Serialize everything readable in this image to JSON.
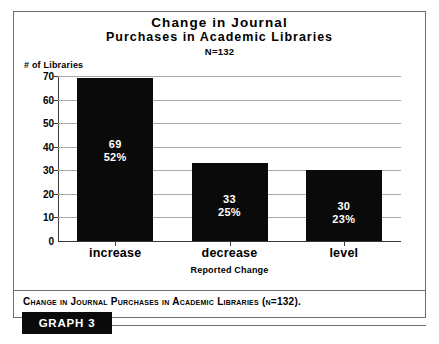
{
  "figure": {
    "caption": "Change in Journal Purchases in Academic Libraries (n=132).",
    "graph_label": "GRAPH 3"
  },
  "chart_data": {
    "type": "bar",
    "title": "Change in Journal Purchases in Academic Libraries",
    "title_line1": "Change in Journal",
    "title_line2": "Purchases in Academic Libraries",
    "subtitle": "N=132",
    "xlabel": "Reported Change",
    "ylabel": "# of Libraries",
    "categories": [
      "increase",
      "decrease",
      "level"
    ],
    "values": [
      69,
      33,
      30
    ],
    "value_labels": [
      "69",
      "33",
      "30"
    ],
    "percent_labels": [
      "52%",
      "25%",
      "23%"
    ],
    "percents": [
      52,
      25,
      23
    ],
    "ylim": [
      0,
      70
    ],
    "yticks": [
      0,
      10,
      20,
      30,
      40,
      50,
      60,
      70
    ],
    "ytick_labels": [
      "0",
      "10",
      "20",
      "30",
      "40",
      "50",
      "60",
      "70"
    ],
    "grid": true,
    "legend": "none",
    "bar_color": "#0a0a0a",
    "grid_color": "#a9a9a9",
    "label_color": "#ffffff"
  }
}
